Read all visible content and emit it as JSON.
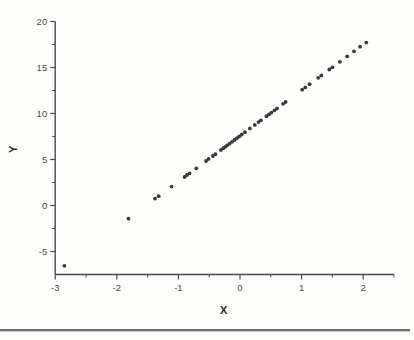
{
  "figure": {
    "background_color": "#fdfdfc",
    "bottom_rule_color": "#6e6e6e"
  },
  "chart_data": {
    "type": "scatter",
    "title": "",
    "xlabel": "X",
    "ylabel": "Y",
    "xlim": [
      -3,
      2.5
    ],
    "ylim": [
      -7.5,
      20
    ],
    "grid": false,
    "legend": false,
    "axis_color": "#4a4a4a",
    "point_color": "#3a3a3a",
    "point_radius_px": 1.9,
    "x_major_ticks": [
      -3,
      -2,
      -1,
      0,
      1,
      2
    ],
    "x_major_tick_labels": [
      "-3",
      "-2",
      "-1",
      "0",
      "1",
      "2"
    ],
    "x_minor_ticks": [
      -2.5,
      -1.5,
      -0.5,
      0.5,
      1.5,
      2.5
    ],
    "y_major_ticks": [
      20,
      15,
      10,
      5,
      0,
      -5
    ],
    "y_major_tick_labels": [
      "20",
      "15",
      "10",
      "5",
      "0",
      "-5"
    ],
    "y_minor_ticks": [
      17.5,
      12.5,
      7.5,
      2.5,
      -2.5
    ],
    "relationship": "approximately linear: y = 5x + 7.6",
    "points": [
      [
        -2.85,
        -6.55
      ],
      [
        -1.81,
        -1.43
      ],
      [
        -1.38,
        0.75
      ],
      [
        -1.32,
        1.01
      ],
      [
        -1.11,
        2.05
      ],
      [
        -0.9,
        3.1
      ],
      [
        -0.86,
        3.32
      ],
      [
        -0.82,
        3.49
      ],
      [
        -0.71,
        4.04
      ],
      [
        -0.55,
        4.84
      ],
      [
        -0.51,
        5.06
      ],
      [
        -0.44,
        5.38
      ],
      [
        -0.4,
        5.58
      ],
      [
        -0.31,
        6.03
      ],
      [
        -0.27,
        6.23
      ],
      [
        -0.24,
        6.38
      ],
      [
        -0.21,
        6.53
      ],
      [
        -0.17,
        6.72
      ],
      [
        -0.13,
        6.92
      ],
      [
        -0.09,
        7.12
      ],
      [
        -0.05,
        7.32
      ],
      [
        -0.01,
        7.52
      ],
      [
        0.03,
        7.72
      ],
      [
        0.08,
        7.97
      ],
      [
        0.16,
        8.37
      ],
      [
        0.24,
        8.76
      ],
      [
        0.3,
        9.06
      ],
      [
        0.34,
        9.26
      ],
      [
        0.43,
        9.71
      ],
      [
        0.47,
        9.91
      ],
      [
        0.51,
        10.1
      ],
      [
        0.56,
        10.35
      ],
      [
        0.6,
        10.55
      ],
      [
        0.7,
        11.05
      ],
      [
        0.74,
        11.25
      ],
      [
        1.01,
        12.59
      ],
      [
        1.06,
        12.84
      ],
      [
        1.13,
        13.19
      ],
      [
        1.27,
        13.88
      ],
      [
        1.32,
        14.13
      ],
      [
        1.45,
        14.78
      ],
      [
        1.5,
        15.02
      ],
      [
        1.62,
        15.62
      ],
      [
        1.74,
        16.22
      ],
      [
        1.85,
        16.76
      ],
      [
        1.95,
        17.26
      ],
      [
        2.05,
        17.71
      ]
    ]
  }
}
